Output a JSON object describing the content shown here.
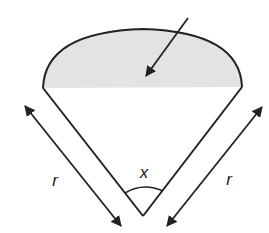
{
  "diagram": {
    "type": "sector-with-shaded-segment",
    "colors": {
      "stroke": "#222222",
      "segment_fill": "#e3e3e3",
      "background": "#ffffff"
    },
    "labels": {
      "angle": "x",
      "radius_left": "r",
      "radius_right": "r"
    },
    "elements": [
      {
        "name": "shaded-segment",
        "note": "area between chord and arc"
      },
      {
        "name": "segment-pointer-arrow",
        "note": "arrow pointing into shaded segment"
      },
      {
        "name": "radius-left",
        "label": "r"
      },
      {
        "name": "radius-right",
        "label": "r"
      },
      {
        "name": "angle-arc",
        "label": "x"
      }
    ]
  }
}
